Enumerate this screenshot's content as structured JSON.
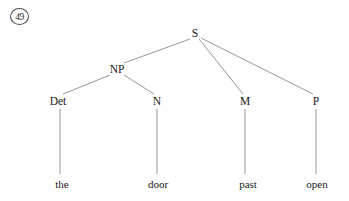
{
  "figure": {
    "example_number": "49",
    "type": "syntax-tree",
    "sentence": "the door past open",
    "nodes": [
      {
        "id": "S",
        "label": "S",
        "x": 195,
        "y": 33,
        "kind": "root"
      },
      {
        "id": "NP",
        "label": "NP",
        "x": 117,
        "y": 69,
        "kind": "phrase"
      },
      {
        "id": "Det",
        "label": "Det",
        "x": 58,
        "y": 101,
        "kind": "category"
      },
      {
        "id": "N",
        "label": "N",
        "x": 157,
        "y": 101,
        "kind": "category"
      },
      {
        "id": "M",
        "label": "M",
        "x": 245,
        "y": 101,
        "kind": "category"
      },
      {
        "id": "P",
        "label": "P",
        "x": 316,
        "y": 101,
        "kind": "category"
      }
    ],
    "terminals": [
      {
        "id": "the",
        "label": "the",
        "x": 62,
        "y": 184,
        "parent": "Det"
      },
      {
        "id": "door",
        "label": "door",
        "x": 158,
        "y": 184,
        "parent": "N"
      },
      {
        "id": "past",
        "label": "past",
        "x": 248,
        "y": 184,
        "parent": "M"
      },
      {
        "id": "open",
        "label": "open",
        "x": 317,
        "y": 184,
        "parent": "P"
      }
    ],
    "edges": [
      {
        "from": "S",
        "to": "NP",
        "x1": 190,
        "y1": 39,
        "x2": 124,
        "y2": 63
      },
      {
        "from": "S",
        "to": "M",
        "x1": 199,
        "y1": 39,
        "x2": 243,
        "y2": 94
      },
      {
        "from": "S",
        "to": "P",
        "x1": 201,
        "y1": 38,
        "x2": 313,
        "y2": 94
      },
      {
        "from": "NP",
        "to": "Det",
        "x1": 110,
        "y1": 75,
        "x2": 63,
        "y2": 94
      },
      {
        "from": "NP",
        "to": "N",
        "x1": 124,
        "y1": 75,
        "x2": 154,
        "y2": 94
      },
      {
        "from": "Det",
        "to": "the",
        "x1": 60,
        "y1": 109,
        "x2": 60,
        "y2": 174
      },
      {
        "from": "N",
        "to": "door",
        "x1": 157,
        "y1": 109,
        "x2": 157,
        "y2": 174
      },
      {
        "from": "M",
        "to": "past",
        "x1": 245,
        "y1": 109,
        "x2": 245,
        "y2": 174
      },
      {
        "from": "P",
        "to": "open",
        "x1": 316,
        "y1": 109,
        "x2": 316,
        "y2": 174
      }
    ],
    "colors": {
      "background": "#ffffff",
      "line": "#8a8a8a",
      "text": "#171717",
      "circle_border": "#4a4a4a"
    }
  }
}
